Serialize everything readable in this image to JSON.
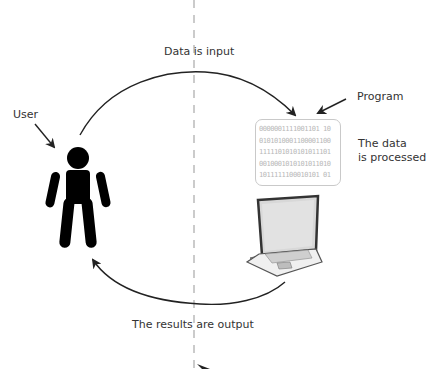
{
  "diagram": {
    "labels": {
      "input": "Data is input",
      "output": "The results are output",
      "user": "User",
      "program": "Program",
      "processed_line1": "The data",
      "processed_line2": "is processed"
    },
    "binary_lines": [
      "0000001111001101 10",
      "0101010001100001100",
      "1111101010101011101",
      "0010001010101011010",
      "1011111100010101 01"
    ],
    "colors": {
      "arrow": "#222222",
      "divider": "#bbbbbb",
      "binary_text": "#b8b8b8",
      "figure": "#000000"
    }
  }
}
